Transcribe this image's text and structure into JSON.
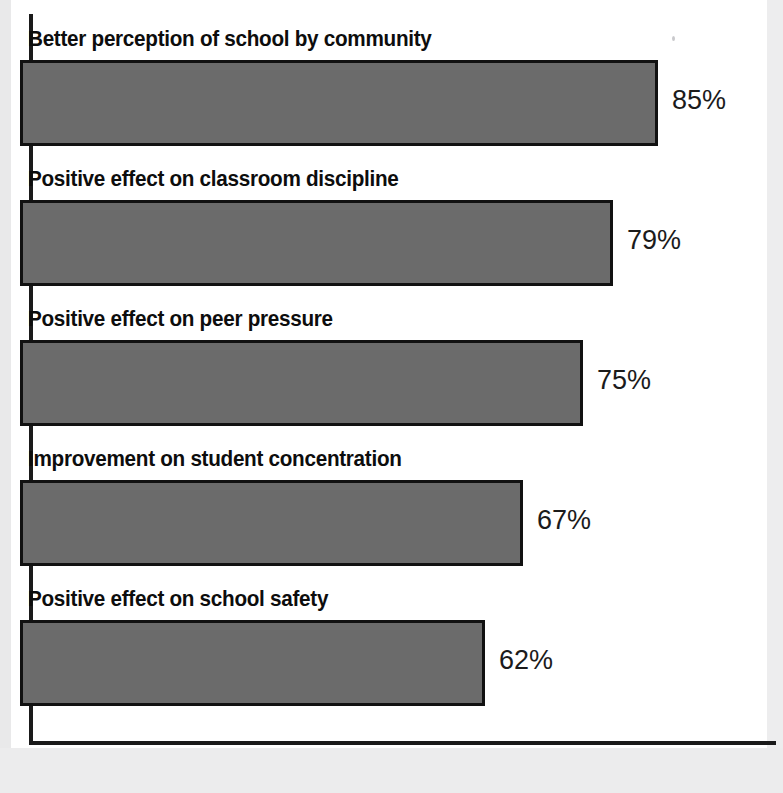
{
  "chart_data": {
    "type": "bar",
    "orientation": "horizontal",
    "title": "",
    "xlabel": "",
    "ylabel": "",
    "xlim": [
      0,
      100
    ],
    "grid": false,
    "legend": false,
    "categories": [
      "Better perception of school by community",
      "Positive effect on classroom discipline",
      "Positive effect on peer pressure",
      "Improvement on student concentration",
      "Positive effect on school safety"
    ],
    "values": [
      85,
      79,
      75,
      67,
      62
    ],
    "value_labels": [
      "85%",
      "79%",
      "75%",
      "67%",
      "62%"
    ],
    "bar_fill_color": "#6b6b6b",
    "bar_border_color": "#111111",
    "axis_color": "#1a1a1a",
    "background_color": "#ffffff"
  },
  "bars": [
    {
      "label": "Better perception of school by community",
      "value": 85,
      "value_label": "85%"
    },
    {
      "label": "Positive effect on classroom discipline",
      "value": 79,
      "value_label": "79%"
    },
    {
      "label": "Positive effect on peer pressure",
      "value": 75,
      "value_label": "75%"
    },
    {
      "label": "Improvement on student concentration",
      "value": 67,
      "value_label": "67%"
    },
    {
      "label": "Positive effect on school safety",
      "value": 62,
      "value_label": "62%"
    }
  ]
}
